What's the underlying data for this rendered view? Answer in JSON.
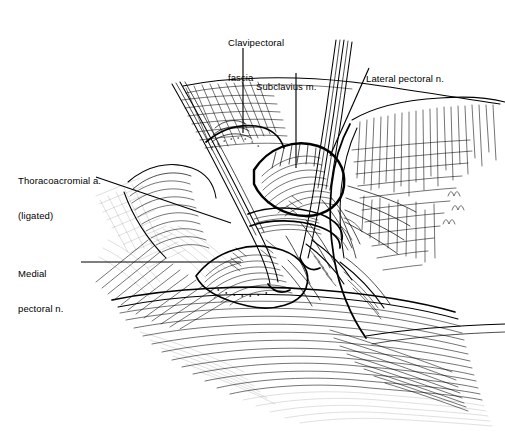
{
  "figure": {
    "kind": "surgical-anatomy-line-drawing",
    "technique": "pen-and-ink hatching",
    "background_color": "#ffffff",
    "ink_color": "#000000",
    "width": 505,
    "height": 434
  },
  "labels": [
    {
      "id": "clavipectoral-fascia",
      "lines": [
        "Clavipectoral",
        "fascia"
      ],
      "text_x": 228,
      "text_y": 14,
      "leader": {
        "type": "vertical",
        "x": 243,
        "y1": 48,
        "y2": 133
      }
    },
    {
      "id": "subclavius-muscle",
      "lines": [
        "Subclavius m."
      ],
      "text_x": 256,
      "text_y": 58,
      "leader": {
        "type": "vertical",
        "x": 296,
        "y1": 73,
        "y2": 168
      }
    },
    {
      "id": "lateral-pectoral-nerve",
      "lines": [
        "Lateral pectoral n."
      ],
      "text_x": 366,
      "text_y": 50,
      "leader": {
        "type": "diagonal",
        "x1": 369,
        "y1": 68,
        "x2": 330,
        "y2": 156
      }
    },
    {
      "id": "thoracoacromial-artery",
      "lines": [
        "Thoracoacromial a.",
        "(ligated)"
      ],
      "text_x": 18,
      "text_y": 152,
      "leader": {
        "type": "diagonal",
        "x1": 96,
        "y1": 177,
        "x2": 231,
        "y2": 223
      }
    },
    {
      "id": "medial-pectoral-nerve",
      "lines": [
        "Medial",
        "pectoral n."
      ],
      "text_x": 18,
      "text_y": 245,
      "leader": {
        "type": "horizontal",
        "x1": 81,
        "y1": 262,
        "x2": 241,
        "y2": 262
      }
    }
  ],
  "structures": [
    {
      "id": "retractor-blade-upper-left",
      "description": "Retractor blade entering from upper left"
    },
    {
      "id": "retractor-blade-upper-right",
      "description": "Retractor blade entering from upper right"
    },
    {
      "id": "clavipectoral-fascia-sheet",
      "description": "Cross-hatched fascial sheet"
    },
    {
      "id": "subclavius-muscle-belly",
      "description": "Striated muscle belly beneath clavicle"
    },
    {
      "id": "pectoralis-major-flap",
      "description": "Reflected pectoralis major with fiber hatching"
    },
    {
      "id": "neurovascular-bundle",
      "description": "Axillary vessels and pectoral nerves in field"
    },
    {
      "id": "skin-edge-lower",
      "description": "Lower skin and subcutaneous sweep strokes"
    }
  ]
}
